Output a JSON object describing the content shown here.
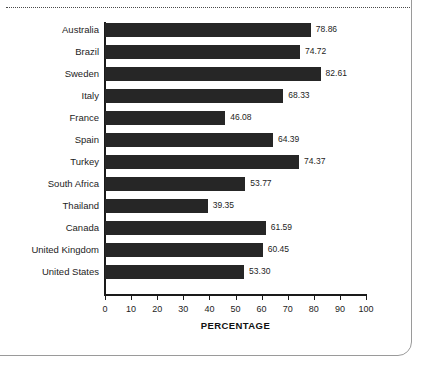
{
  "chart_data": {
    "type": "bar",
    "orientation": "horizontal",
    "title": "",
    "xlabel": "PERCENTAGE",
    "ylabel": "",
    "xlim": [
      0,
      100
    ],
    "xticks": [
      0,
      10,
      20,
      30,
      40,
      50,
      60,
      70,
      80,
      90,
      100
    ],
    "grid": false,
    "legend": null,
    "bar_color": "#262626",
    "categories": [
      "Australia",
      "Brazil",
      "Sweden",
      "Italy",
      "France",
      "Spain",
      "Turkey",
      "South Africa",
      "Thailand",
      "Canada",
      "United Kingdom",
      "United States"
    ],
    "values": [
      78.86,
      74.72,
      82.61,
      68.33,
      46.08,
      64.39,
      74.37,
      53.77,
      39.35,
      61.59,
      60.45,
      53.3
    ],
    "value_labels": [
      "78.86",
      "74.72",
      "82.61",
      "68.33",
      "46.08",
      "64.39",
      "74.37",
      "53.77",
      "39.35",
      "61.59",
      "60.45",
      "53.30"
    ]
  }
}
